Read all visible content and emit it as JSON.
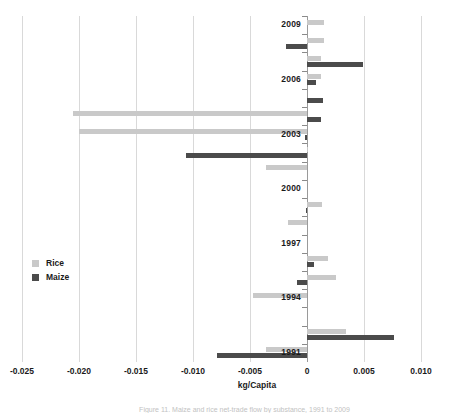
{
  "chart_data": {
    "type": "bar",
    "orientation": "horizontal",
    "title": "",
    "xlabel": "kg/Capita",
    "ylabel": "",
    "xlim": [
      -0.025,
      0.01
    ],
    "xticks": [
      "-0.025",
      "-0.020",
      "-0.015",
      "-0.010",
      "-0.005",
      "0",
      "0.005",
      "0.010"
    ],
    "xtick_values": [
      -0.025,
      -0.02,
      -0.015,
      -0.01,
      -0.005,
      0,
      0.005,
      0.01
    ],
    "grid": true,
    "legend_position": "center-left",
    "categories": [
      2009,
      2008,
      2007,
      2006,
      2005,
      2004,
      2003,
      2002,
      2001,
      2000,
      1999,
      1998,
      1997,
      1996,
      1995,
      1994,
      1993,
      1992,
      1991
    ],
    "visible_category_labels": [
      "2009",
      "2006",
      "2003",
      "2000",
      "1997",
      "1994",
      "1991"
    ],
    "series": [
      {
        "name": "Rice",
        "color": "#c9c9c9",
        "values": [
          0.0015,
          0.0015,
          0.0012,
          0.0012,
          0.0,
          -0.0205,
          -0.02,
          0.0001,
          -0.0036,
          0.0,
          0.0013,
          -0.0017,
          0.0,
          0.0018,
          0.0025,
          -0.0047,
          0.0,
          0.0034,
          -0.0036
        ]
      },
      {
        "name": "Maize",
        "color": "#4b4b4b",
        "values": [
          0.0,
          -0.0018,
          0.0049,
          0.0008,
          0.0014,
          0.0012,
          -0.0002,
          -0.0106,
          0.0,
          0.0,
          -0.0001,
          0.0,
          0.0,
          0.0006,
          -0.0009,
          0.0,
          0.0,
          0.0076,
          -0.0079
        ]
      }
    ]
  },
  "legend": {
    "entries": [
      {
        "label": "Rice",
        "swatch": "rice-swatch"
      },
      {
        "label": "Maize",
        "swatch": "maize-swatch"
      }
    ]
  },
  "axis": {
    "x_title": "kg/Capita"
  },
  "caption": {
    "text": "Figure 11. Maize and rice net-trade flow by substance, 1991 to 2009"
  }
}
